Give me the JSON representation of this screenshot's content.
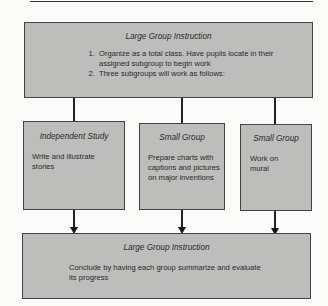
{
  "diagram": {
    "top_box": {
      "title": "Large Group Instruction",
      "items": [
        "Organize as a total class.  Have pupils locate in their assigned subgroup to begin work",
        "Three subgroups will work as follows:"
      ]
    },
    "subgroups": [
      {
        "title": "Independent Study",
        "text": "Write and illustrate stories"
      },
      {
        "title": "Small Group",
        "text": "Prepare charts with captions and pictures on major inventions"
      },
      {
        "title": "Small Group",
        "text": "Work on mural"
      }
    ],
    "bottom_box": {
      "title": "Large Group Instruction",
      "text": "Conclude by having each group summarize and evaluate its progress"
    },
    "colors": {
      "box_fill": "#bdbdbb",
      "border": "#444444",
      "background": "#fbfbf9"
    }
  }
}
